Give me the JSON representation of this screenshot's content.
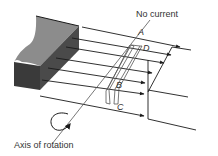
{
  "diagram": {
    "labels": {
      "state": "No current",
      "axis": "Axis of rotation",
      "side_a": "A",
      "side_b": "B",
      "side_c": "C",
      "side_d": "D"
    },
    "colors": {
      "magnet_top": "#8c8c8c",
      "magnet_front": "#3a3a3a",
      "magnet_side": "#555555",
      "line": "#1a1a1a",
      "coil": "#555555",
      "text": "#333333"
    }
  }
}
